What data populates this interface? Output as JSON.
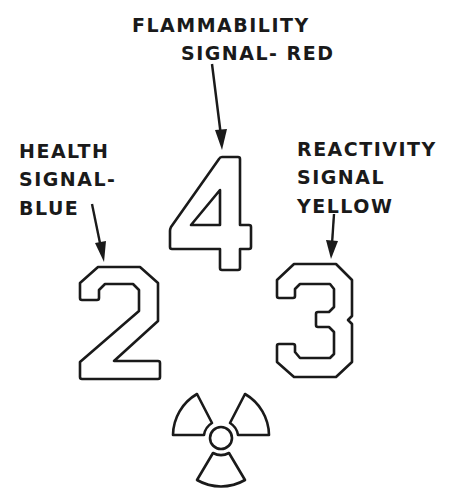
{
  "diagram": {
    "type": "hazard-signal-diagram",
    "labels": {
      "flammability": {
        "lines": [
          "FLAMMABILITY",
          "SIGNAL- RED"
        ],
        "value": "4",
        "color_name": "RED"
      },
      "health": {
        "lines": [
          "HEALTH",
          "SIGNAL-",
          "BLUE"
        ],
        "value": "2",
        "color_name": "BLUE"
      },
      "reactivity": {
        "lines": [
          "REACTIVITY",
          "SIGNAL",
          "YELLOW"
        ],
        "value": "3",
        "color_name": "YELLOW"
      }
    },
    "numbers": {
      "top": "4",
      "left": "2",
      "right": "3"
    },
    "special_symbol": "radiation-trefoil",
    "colors": {
      "ink": "#1a1a1a",
      "background": "#ffffff"
    }
  }
}
